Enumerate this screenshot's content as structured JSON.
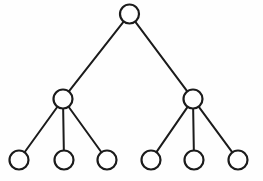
{
  "diagram": {
    "type": "tree-graph",
    "canvas": {
      "width": 263,
      "height": 181
    },
    "style": {
      "background_color": "#fefefe",
      "node_fill": "#ffffff",
      "node_stroke": "#1b1b1b",
      "node_stroke_width": 2.2,
      "edge_color": "#1b1b1b",
      "edge_width": 2,
      "node_radius": 9.5
    },
    "nodes": [
      {
        "id": "root",
        "label": "",
        "level": 0,
        "x": 129.5,
        "y": 14,
        "r": 9.5,
        "name": "root-node"
      },
      {
        "id": "left",
        "label": "",
        "level": 1,
        "x": 63,
        "y": 99,
        "r": 9.5,
        "name": "internal-node-left"
      },
      {
        "id": "right",
        "label": "",
        "level": 1,
        "x": 193,
        "y": 99,
        "r": 9.5,
        "name": "internal-node-right"
      },
      {
        "id": "leaf1",
        "label": "",
        "level": 2,
        "x": 19,
        "y": 160,
        "r": 9.5,
        "name": "leaf-node-1"
      },
      {
        "id": "leaf2",
        "label": "",
        "level": 2,
        "x": 64,
        "y": 160,
        "r": 9.5,
        "name": "leaf-node-2"
      },
      {
        "id": "leaf3",
        "label": "",
        "level": 2,
        "x": 107,
        "y": 160,
        "r": 9.5,
        "name": "leaf-node-3"
      },
      {
        "id": "leaf4",
        "label": "",
        "level": 2,
        "x": 151,
        "y": 160,
        "r": 9.5,
        "name": "leaf-node-4"
      },
      {
        "id": "leaf5",
        "label": "",
        "level": 2,
        "x": 194,
        "y": 160,
        "r": 9.5,
        "name": "leaf-node-5"
      },
      {
        "id": "leaf6",
        "label": "",
        "level": 2,
        "x": 238,
        "y": 160,
        "r": 9.5,
        "name": "leaf-node-6"
      }
    ],
    "edges": [
      {
        "from": "root",
        "to": "left",
        "name": "edge-root-left"
      },
      {
        "from": "root",
        "to": "right",
        "name": "edge-root-right"
      },
      {
        "from": "left",
        "to": "leaf1",
        "name": "edge-left-leaf1"
      },
      {
        "from": "left",
        "to": "leaf2",
        "name": "edge-left-leaf2"
      },
      {
        "from": "left",
        "to": "leaf3",
        "name": "edge-left-leaf3"
      },
      {
        "from": "right",
        "to": "leaf4",
        "name": "edge-right-leaf4"
      },
      {
        "from": "right",
        "to": "leaf5",
        "name": "edge-right-leaf5"
      },
      {
        "from": "right",
        "to": "leaf6",
        "name": "edge-right-leaf6"
      }
    ]
  }
}
